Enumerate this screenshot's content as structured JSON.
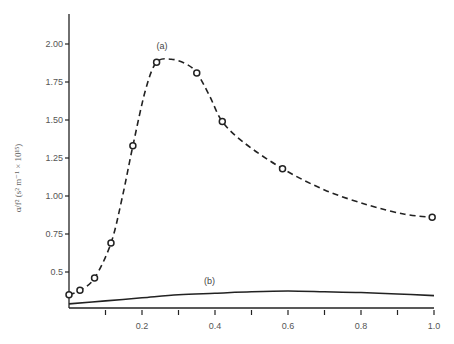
{
  "chart_data": {
    "type": "line",
    "title": "",
    "xlabel": "",
    "ylabel": "α/f² (s² m⁻¹ × 10¹⁵)",
    "xlim": [
      0,
      1.0
    ],
    "ylim": [
      0.26,
      2.2
    ],
    "x_ticks": [
      0.1,
      0.2,
      0.3,
      0.4,
      0.5,
      0.6,
      0.7,
      0.8,
      0.9,
      1.0
    ],
    "x_tick_labels": [
      "",
      "0.2",
      "",
      "0.4",
      "",
      "0.6",
      "",
      "0.8",
      "",
      "1.0"
    ],
    "y_ticks": [
      0.5,
      0.75,
      1.0,
      1.25,
      1.5,
      1.75,
      2.0
    ],
    "y_tick_labels": [
      "0.5",
      "0.75",
      "1.00",
      "1.25",
      "1.50",
      "1.75",
      "2.00"
    ],
    "grid": false,
    "legend": null,
    "series": [
      {
        "name": "(a)",
        "style": "dashed",
        "markers": "open-circle",
        "points": [
          {
            "x": 0.0,
            "y": 0.35
          },
          {
            "x": 0.03,
            "y": 0.38
          },
          {
            "x": 0.07,
            "y": 0.46
          },
          {
            "x": 0.115,
            "y": 0.69
          },
          {
            "x": 0.175,
            "y": 1.33
          },
          {
            "x": 0.24,
            "y": 1.88
          },
          {
            "x": 0.35,
            "y": 1.81
          },
          {
            "x": 0.42,
            "y": 1.49
          },
          {
            "x": 0.585,
            "y": 1.18
          },
          {
            "x": 0.995,
            "y": 0.86
          }
        ],
        "curve": [
          {
            "x": 0.0,
            "y": 0.35
          },
          {
            "x": 0.03,
            "y": 0.38
          },
          {
            "x": 0.07,
            "y": 0.46
          },
          {
            "x": 0.115,
            "y": 0.69
          },
          {
            "x": 0.145,
            "y": 0.98
          },
          {
            "x": 0.175,
            "y": 1.33
          },
          {
            "x": 0.21,
            "y": 1.7
          },
          {
            "x": 0.24,
            "y": 1.88
          },
          {
            "x": 0.28,
            "y": 1.9
          },
          {
            "x": 0.32,
            "y": 1.87
          },
          {
            "x": 0.35,
            "y": 1.81
          },
          {
            "x": 0.385,
            "y": 1.66
          },
          {
            "x": 0.42,
            "y": 1.49
          },
          {
            "x": 0.48,
            "y": 1.35
          },
          {
            "x": 0.585,
            "y": 1.18
          },
          {
            "x": 0.7,
            "y": 1.04
          },
          {
            "x": 0.82,
            "y": 0.94
          },
          {
            "x": 0.92,
            "y": 0.88
          },
          {
            "x": 0.995,
            "y": 0.86
          }
        ],
        "annotation": {
          "text": "(a)",
          "x": 0.255,
          "y": 1.97
        }
      },
      {
        "name": "(b)",
        "style": "solid",
        "markers": "none",
        "curve": [
          {
            "x": 0.0,
            "y": 0.29
          },
          {
            "x": 0.1,
            "y": 0.31
          },
          {
            "x": 0.2,
            "y": 0.33
          },
          {
            "x": 0.3,
            "y": 0.35
          },
          {
            "x": 0.4,
            "y": 0.36
          },
          {
            "x": 0.5,
            "y": 0.37
          },
          {
            "x": 0.6,
            "y": 0.375
          },
          {
            "x": 0.7,
            "y": 0.37
          },
          {
            "x": 0.8,
            "y": 0.365
          },
          {
            "x": 0.9,
            "y": 0.355
          },
          {
            "x": 1.0,
            "y": 0.345
          }
        ],
        "annotation": {
          "text": "(b)",
          "x": 0.385,
          "y": 0.42
        }
      }
    ]
  },
  "axes": {
    "ylabel_text": "α/f² (s² m⁻¹ × 10¹⁵)"
  }
}
